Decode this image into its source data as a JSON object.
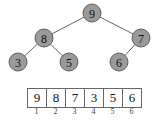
{
  "tree": {
    "nodes": [
      {
        "id": "n1",
        "label": "9",
        "x": 92,
        "y": 13
      },
      {
        "id": "n2",
        "label": "8",
        "x": 44,
        "y": 38
      },
      {
        "id": "n3",
        "label": "7",
        "x": 141,
        "y": 38
      },
      {
        "id": "n4",
        "label": "3",
        "x": 18,
        "y": 62
      },
      {
        "id": "n5",
        "label": "5",
        "x": 69,
        "y": 62
      },
      {
        "id": "n6",
        "label": "6",
        "x": 119,
        "y": 62
      }
    ],
    "edges": [
      [
        "n1",
        "n2"
      ],
      [
        "n1",
        "n3"
      ],
      [
        "n2",
        "n4"
      ],
      [
        "n2",
        "n5"
      ],
      [
        "n3",
        "n6"
      ]
    ],
    "node_color": "#9a9a9a",
    "edge_color": "#555555"
  },
  "array": {
    "values": [
      "9",
      "8",
      "7",
      "3",
      "5",
      "6"
    ],
    "indices": [
      "1",
      "2",
      "3",
      "4",
      "5",
      "6"
    ]
  }
}
